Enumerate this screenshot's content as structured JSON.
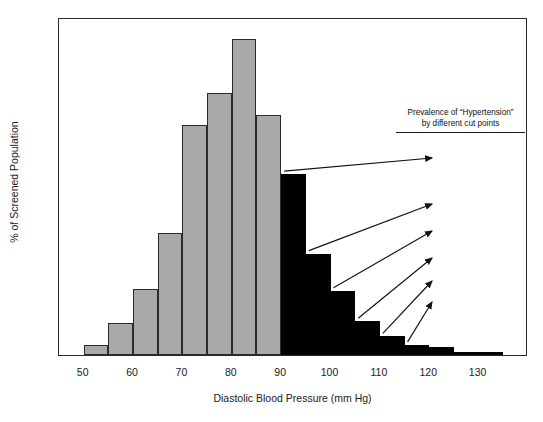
{
  "chart_data": {
    "type": "bar",
    "title": "",
    "xlabel": "Diastolic Blood Pressure (mm Hg)",
    "ylabel": "% of Screened Population",
    "xlim": [
      45,
      140
    ],
    "ylim": [
      0,
      20
    ],
    "xticks": [
      50,
      60,
      70,
      80,
      90,
      100,
      110,
      120,
      130
    ],
    "yticks": [
      0,
      5,
      10,
      15,
      20
    ],
    "grid": false,
    "legend": "none",
    "bin_width": 5,
    "bins": [
      {
        "start": 50,
        "end": 55,
        "value": 0.6,
        "group": "below"
      },
      {
        "start": 55,
        "end": 60,
        "value": 1.9,
        "group": "below"
      },
      {
        "start": 60,
        "end": 65,
        "value": 3.9,
        "group": "below"
      },
      {
        "start": 65,
        "end": 70,
        "value": 7.2,
        "group": "below"
      },
      {
        "start": 70,
        "end": 75,
        "value": 13.6,
        "group": "below"
      },
      {
        "start": 75,
        "end": 80,
        "value": 15.5,
        "group": "below"
      },
      {
        "start": 80,
        "end": 85,
        "value": 18.7,
        "group": "below"
      },
      {
        "start": 85,
        "end": 90,
        "value": 14.2,
        "group": "below"
      },
      {
        "start": 90,
        "end": 95,
        "value": 10.7,
        "group": "atleast"
      },
      {
        "start": 95,
        "end": 100,
        "value": 6.0,
        "group": "atleast"
      },
      {
        "start": 100,
        "end": 105,
        "value": 3.8,
        "group": "atleast"
      },
      {
        "start": 105,
        "end": 110,
        "value": 2.0,
        "group": "atleast"
      },
      {
        "start": 110,
        "end": 115,
        "value": 1.1,
        "group": "atleast"
      },
      {
        "start": 115,
        "end": 120,
        "value": 0.6,
        "group": "atleast"
      },
      {
        "start": 120,
        "end": 125,
        "value": 0.45,
        "group": "atleast"
      },
      {
        "start": 125,
        "end": 130,
        "value": 0.2,
        "group": "atleast"
      },
      {
        "start": 130,
        "end": 135,
        "value": 0.15,
        "group": "atleast"
      }
    ],
    "annotations": {
      "header_line1": "Prevalence of “Hypertension”",
      "header_line2": "by different cut points",
      "items": [
        {
          "label": "≥90 = 25.3%",
          "cutpoint": 90,
          "prevalence": 25.3
        },
        {
          "label": "≥95 = 14.5%",
          "cutpoint": 95,
          "prevalence": 14.5
        },
        {
          "label": "≥100 = 8.4%",
          "cutpoint": 100,
          "prevalence": 8.4
        },
        {
          "label": "≥105 = 4.7%",
          "cutpoint": 105,
          "prevalence": 4.7
        },
        {
          "label": "≥110 = 2.9%",
          "cutpoint": 110,
          "prevalence": 2.9
        },
        {
          "label": "≥115 = 1.4%",
          "cutpoint": 115,
          "prevalence": 1.4
        }
      ]
    },
    "colors": {
      "below_cutpoint": "#a9a9a9",
      "at_or_above_cutpoint": "#000000",
      "axis": "#2b2b2b",
      "background": "#ffffff"
    }
  }
}
